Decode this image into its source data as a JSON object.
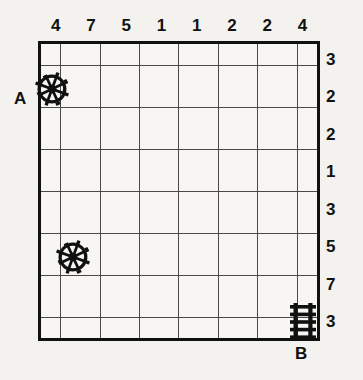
{
  "puzzle": {
    "type": "logic-grid-puzzle",
    "grid": {
      "columns": 8,
      "rows": 8,
      "background_color": "#f7f6f3",
      "border_color": "#111111",
      "gridline_color": "#4a4a4a"
    },
    "column_clues": [
      "4",
      "7",
      "5",
      "1",
      "1",
      "2",
      "2",
      "4"
    ],
    "row_clues": [
      "3",
      "2",
      "2",
      "1",
      "3",
      "5",
      "7",
      "3"
    ],
    "endpoints": [
      {
        "label": "A",
        "position": "left-of-row-2"
      },
      {
        "label": "B",
        "position": "below-column-8"
      }
    ],
    "markers": [
      {
        "id": "wheel-1",
        "icon": "ship-wheel-icon",
        "column": 1,
        "row": 2,
        "anchor": "top-left-corner"
      },
      {
        "id": "wheel-2",
        "icon": "ship-wheel-icon",
        "column": 1,
        "row": 6,
        "anchor": "top-right-corner"
      },
      {
        "id": "ladder-1",
        "icon": "ladder-icon",
        "column": 8,
        "row": 8,
        "anchor": "cell-center"
      }
    ]
  },
  "colors": {
    "page_background": "#f3f2ef",
    "ink": "#111111"
  }
}
